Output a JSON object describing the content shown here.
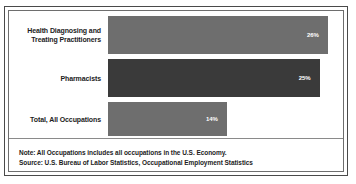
{
  "chart_data": {
    "type": "bar",
    "orientation": "horizontal",
    "title": "",
    "xlabel": "",
    "ylabel": "",
    "categories": [
      "Health Diagnosing and Treating Practitioners",
      "Pharmacists",
      "Total, All Occupations"
    ],
    "values": [
      26,
      25,
      14
    ],
    "value_labels": [
      "26%",
      "25%",
      "14%"
    ],
    "xlim": [
      0,
      35
    ],
    "grid": false,
    "legend": false,
    "bar_colors": [
      "#6e6e6e",
      "#3a3a3a",
      "#6e6e6e"
    ]
  },
  "bars": [
    {
      "label_line1": "Health Diagnosing and",
      "label_line2": "Treating Practitioners",
      "value_label": "26%",
      "width_pct": 93.5,
      "color": "#6e6e6e"
    },
    {
      "label_line1": "Pharmacists",
      "label_line2": "",
      "value_label": "25%",
      "width_pct": 90.0,
      "color": "#3a3a3a"
    },
    {
      "label_line1": "Total, All Occupations",
      "label_line2": "",
      "value_label": "14%",
      "width_pct": 50.5,
      "color": "#6e6e6e"
    }
  ],
  "footnotes": {
    "note": "Note: All Occupations includes all occupations in the U.S. Economy.",
    "source": "Source: U.S. Bureau of Labor Statistics, Occupational Employment Statistics"
  },
  "colors": {
    "outer_border": "#4a4a4a",
    "inner_border": "#6e6e6e",
    "divider": "#8a8a8a",
    "bar_light": "#6e6e6e",
    "bar_dark": "#3a3a3a",
    "text": "#1c1c1c",
    "value_text": "#ffffff",
    "background": "#ffffff"
  }
}
